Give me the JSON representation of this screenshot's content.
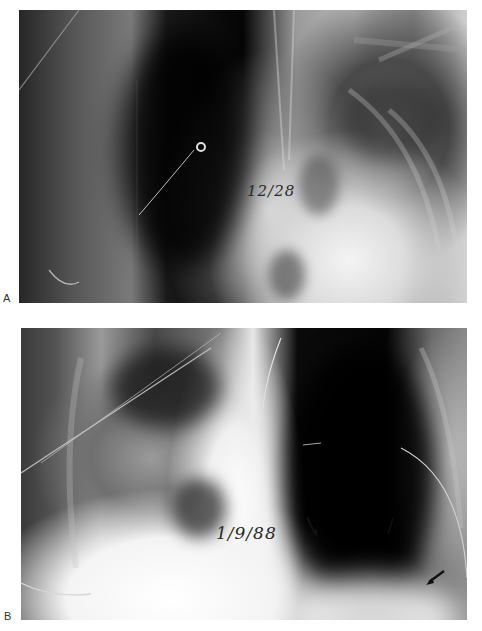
{
  "figure": {
    "panels": [
      {
        "label": "A",
        "description": "Chest radiograph, supine",
        "handwritten_date": "12/28"
      },
      {
        "label": "B",
        "description": "Chest radiograph with arrows marking findings",
        "handwritten_date": "1/9/88",
        "arrow_count": 3
      }
    ]
  }
}
